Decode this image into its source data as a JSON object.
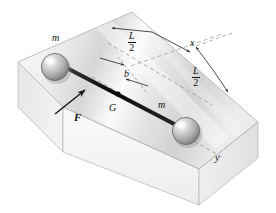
{
  "figure": {
    "labels": {
      "mass_left": "m",
      "mass_right": "m",
      "force": "F",
      "center_of_mass": "G",
      "offset": "b",
      "axis_x": "x",
      "axis_y": "y",
      "half_length_num": "L",
      "half_length_den": "2"
    },
    "colors": {
      "ink": "#101010",
      "rod": "#111111",
      "block_top_light": "#fbfbfb",
      "block_top_mid": "#e2e2e2",
      "block_top_dark": "#cfcfcf",
      "block_front": "#f4f4f4",
      "block_side": "#e8e8e8",
      "sphere_light": "#f2f2f2",
      "sphere_mid": "#b9b9b9",
      "sphere_dark": "#7e7e7e",
      "dashed": "#9a9a9a",
      "outline": "#b0b0b0"
    }
  }
}
